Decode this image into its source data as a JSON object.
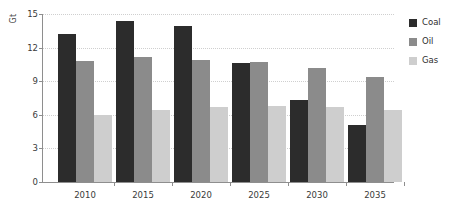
{
  "chart_data": {
    "type": "bar",
    "title": "",
    "subtitle": "",
    "xlabel": "",
    "ylabel": "Gt",
    "categories": [
      "2010",
      "2015",
      "2020",
      "2025",
      "2030",
      "2035"
    ],
    "series": [
      {
        "name": "Coal",
        "color": "#2c2c2c",
        "values": [
          13.2,
          14.4,
          13.9,
          10.6,
          7.3,
          5.1
        ]
      },
      {
        "name": "Oil",
        "color": "#8b8b8b",
        "values": [
          10.8,
          11.2,
          10.9,
          10.7,
          10.2,
          9.4
        ]
      },
      {
        "name": "Gas",
        "color": "#cecece",
        "values": [
          6.0,
          6.4,
          6.7,
          6.8,
          6.7,
          6.4
        ]
      }
    ],
    "ylim": [
      0,
      15
    ],
    "yticks": [
      "0",
      "3",
      "6",
      "9",
      "12",
      "15"
    ],
    "ytick_values": [
      0,
      3,
      6,
      9,
      12,
      15
    ],
    "grid": true,
    "grid_style": "dotted-horizontal",
    "legend_position": "right",
    "legend": [
      "Coal",
      "Oil",
      "Gas"
    ],
    "background": "#ffffff",
    "axis_color": "#8e8e8e",
    "grid_color": "#cfcfcf"
  }
}
